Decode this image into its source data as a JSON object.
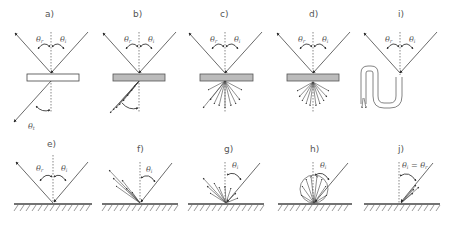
{
  "figure": {
    "panels": [
      {
        "id": "a",
        "label": "a)",
        "type": "regular transmission through clear material",
        "angles": [
          "θr",
          "θi",
          "θt"
        ]
      },
      {
        "id": "b",
        "label": "b)",
        "type": "spread transmission",
        "angles": [
          "θr",
          "θi"
        ]
      },
      {
        "id": "c",
        "label": "c)",
        "type": "mixed diffuse transmission",
        "angles": [
          "θr",
          "θi"
        ]
      },
      {
        "id": "d",
        "label": "d)",
        "type": "diffuse transmission",
        "angles": [
          "θr",
          "θi"
        ]
      },
      {
        "id": "i",
        "label": "i)",
        "type": "light guide / total internal reflection",
        "angles": [
          "θr",
          "θi"
        ]
      },
      {
        "id": "e",
        "label": "e)",
        "type": "specular reflection",
        "angles": [
          "θr",
          "θi"
        ]
      },
      {
        "id": "f",
        "label": "f)",
        "type": "spread reflection",
        "angles": [
          "θi"
        ]
      },
      {
        "id": "g",
        "label": "g)",
        "type": "mixed reflection",
        "angles": [
          "θi"
        ]
      },
      {
        "id": "h",
        "label": "h)",
        "type": "diffuse (Lambertian) reflection",
        "angles": [
          "θi"
        ]
      },
      {
        "id": "j",
        "label": "j)",
        "type": "retroreflection",
        "angles": [
          "θi = θr"
        ]
      }
    ],
    "symbols": {
      "theta_r": "θ",
      "theta_r_sub": "r",
      "theta_i": "θ",
      "theta_i_sub": "i",
      "theta_t": "θ",
      "theta_t_sub": "t",
      "retro": "θi = θr"
    }
  }
}
